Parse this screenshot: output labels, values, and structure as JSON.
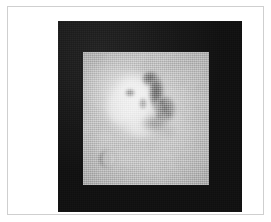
{
  "figure": {
    "kind": "grayscale-photograph",
    "caption": "",
    "alt_text": "Grayscale orbital photograph of a light mesa landform casting shadows, mounted on a black square background",
    "colors": {
      "page_background": "#ffffff",
      "figure_border": "#cfcfcf",
      "mount_black": "#191919",
      "photo_base_gray": "#b9b9b9",
      "photo_highlight": "#efefef",
      "photo_shadow": "#4a4a4a"
    },
    "layout": {
      "page_width": 271,
      "page_height": 222,
      "border_rect": [
        7,
        6,
        257,
        209
      ],
      "mount_rect": [
        50,
        14,
        184,
        191
      ],
      "photo_rect": [
        75,
        45,
        126,
        133
      ]
    },
    "features": [
      {
        "name": "central-mesa",
        "label": "",
        "description": "bright raised landform occupying the middle of the frame",
        "center": [
          0.42,
          0.38
        ],
        "tone": "highlight"
      },
      {
        "name": "shadow-ridge",
        "label": "",
        "description": "dark shadow running down the right flank of the mesa",
        "center": [
          0.62,
          0.42
        ],
        "tone": "shadow"
      },
      {
        "name": "crater",
        "label": "",
        "description": "small circular impact crater near the lower-left of the frame",
        "center": [
          0.19,
          0.8
        ],
        "tone": "mixed"
      },
      {
        "name": "plains",
        "label": "",
        "description": "flat mottled terrain surrounding the landform",
        "center": [
          0.5,
          0.88
        ],
        "tone": "midtone"
      }
    ]
  }
}
